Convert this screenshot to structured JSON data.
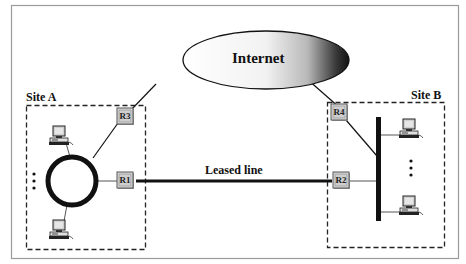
{
  "diagram": {
    "cloud": {
      "label": "Internet"
    },
    "sites": [
      {
        "id": "site-a",
        "label": "Site A",
        "topology": "ring"
      },
      {
        "id": "site-b",
        "label": "Site B",
        "topology": "bus"
      }
    ],
    "routers": [
      {
        "id": "R1",
        "label": "R1",
        "site": "Site A"
      },
      {
        "id": "R2",
        "label": "R2",
        "site": "Site B"
      },
      {
        "id": "R3",
        "label": "R3",
        "site": "Site A"
      },
      {
        "id": "R4",
        "label": "R4",
        "site": "Site B"
      }
    ],
    "links": [
      {
        "from": "R1",
        "to": "R2",
        "label": "Leased line"
      },
      {
        "from": "R3",
        "to": "Internet",
        "label": ""
      },
      {
        "from": "R4",
        "to": "Internet",
        "label": ""
      }
    ],
    "ellipsis": "⋮",
    "colors": {
      "frame": "#9a9a9a",
      "line": "#111111",
      "router_fill": "#d9d9d9",
      "computer_screen": "#cfcfcf"
    }
  }
}
